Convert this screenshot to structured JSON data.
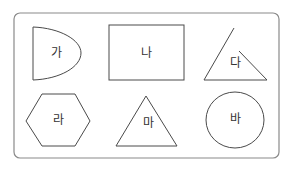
{
  "figure": {
    "type": "shape-classification-card",
    "frame_color": "#8a8a8a",
    "stroke_color": "#4a4a4a",
    "shapes": [
      {
        "label": "가",
        "kind": "semicircle-like (one straight side, one curved side)"
      },
      {
        "label": "나",
        "kind": "rectangle"
      },
      {
        "label": "다",
        "kind": "open triangle (gap in one side)"
      },
      {
        "label": "라",
        "kind": "hexagon"
      },
      {
        "label": "마",
        "kind": "triangle"
      },
      {
        "label": "바",
        "kind": "circle"
      }
    ]
  }
}
